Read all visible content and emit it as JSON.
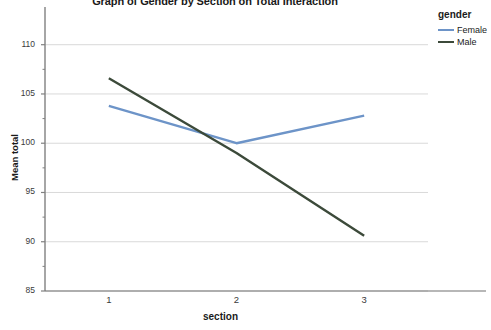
{
  "chart_data": {
    "type": "line",
    "title": "Graph of Gender by Section on Total Interaction",
    "xlabel": "section",
    "ylabel": "Mean total",
    "categories": [
      "1",
      "2",
      "3"
    ],
    "x": [
      1,
      2,
      3
    ],
    "series": [
      {
        "name": "Female",
        "color": "#6d94c8",
        "values": [
          103.8,
          100.0,
          102.8
        ]
      },
      {
        "name": "Male",
        "color": "#3c4a3a",
        "values": [
          106.6,
          99.0,
          90.6
        ]
      }
    ],
    "ylim": [
      85,
      112
    ],
    "yticks": [
      85,
      90,
      95,
      100,
      105,
      110
    ],
    "ytick_labels": [
      "85",
      "90",
      "95",
      "100",
      "105",
      "110"
    ],
    "minor_yticks": [
      87.5,
      92.5,
      97.5,
      102.5,
      107.5
    ],
    "grid": true,
    "grid_axis": "y",
    "legend": {
      "title": "gender",
      "position": "right",
      "entries": [
        "Female",
        "Male"
      ]
    }
  },
  "colors": {
    "background": "#ffffff",
    "axis": "#808080",
    "grid": "#d9d9d9",
    "text": "#1a1a1a",
    "female": "#6d94c8",
    "male": "#3c4a3a"
  }
}
